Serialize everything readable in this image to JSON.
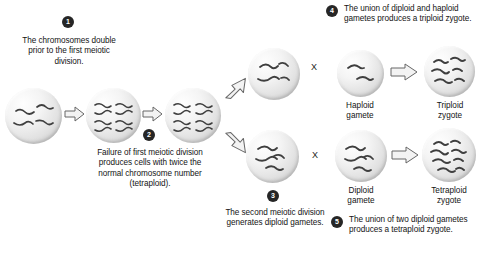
{
  "diagram": {
    "steps": [
      {
        "number": "1",
        "text": "The chromosomes double prior to the first meiotic division."
      },
      {
        "number": "2",
        "text": "Failure of first meiotic division produces cells with twice the normal chromosome number (tetraploid)."
      },
      {
        "number": "3",
        "text": "The second meiotic division generates diploid gametes."
      },
      {
        "number": "4",
        "text": "The union of diploid and haploid gametes produces a triploid zygote."
      },
      {
        "number": "5",
        "text": "The union of two diploid gametes produces a tetraploid zygote."
      }
    ],
    "cells": [
      {
        "id": "parent-cell",
        "label": "",
        "chromosomes": 4
      },
      {
        "id": "doubled-cell",
        "label": "",
        "chromosomes": 8
      },
      {
        "id": "tetraploid-cell",
        "label": "",
        "chromosomes": 8
      },
      {
        "id": "diploid-gamete-upper",
        "label": "",
        "chromosomes": 4
      },
      {
        "id": "diploid-gamete-lower",
        "label": "",
        "chromosomes": 4
      },
      {
        "id": "haploid-gamete",
        "label": "Haploid\ngamete",
        "chromosomes": 2
      },
      {
        "id": "triploid-zygote",
        "label": "Triploid\nzygote",
        "chromosomes": 6
      },
      {
        "id": "diploid-gamete-right",
        "label": "Diploid\ngamete",
        "chromosomes": 4
      },
      {
        "id": "tetraploid-zygote",
        "label": "Tetraploid\nzygote",
        "chromosomes": 8
      }
    ],
    "cell_labels": {
      "haploid_gamete_line1": "Haploid",
      "haploid_gamete_line2": "gamete",
      "triploid_zygote_line1": "Triploid",
      "triploid_zygote_line2": "zygote",
      "diploid_gamete_line1": "Diploid",
      "diploid_gamete_line2": "gamete",
      "tetraploid_zygote_line1": "Tetraploid",
      "tetraploid_zygote_line2": "zygote"
    },
    "cross_symbol": "X",
    "colors": {
      "background": "#ffffff",
      "text": "#141414",
      "badge_fill": "#262626",
      "badge_text": "#ffffff",
      "cell_fill": "#efefef",
      "cell_edge": "#bdbdbd",
      "chromosome": "#3a3a3a",
      "arrow_fill": "#f2f2f2",
      "arrow_stroke": "#555555"
    }
  }
}
